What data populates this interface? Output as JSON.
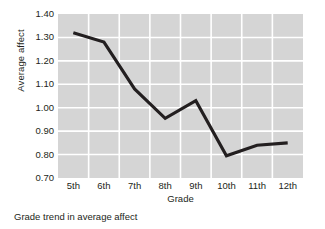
{
  "chart_data": {
    "type": "line",
    "title": "",
    "caption": "Grade trend in average affect",
    "xlabel": "Grade",
    "ylabel": "Average affect",
    "categories": [
      "5th",
      "6th",
      "7th",
      "8th",
      "9th",
      "10th",
      "11th",
      "12th"
    ],
    "values": [
      1.32,
      1.28,
      1.08,
      0.955,
      1.03,
      0.795,
      0.84,
      0.85
    ],
    "ylim": [
      0.7,
      1.4
    ],
    "yticks": [
      0.7,
      0.8,
      0.9,
      1.0,
      1.1,
      1.2,
      1.3,
      1.4
    ],
    "ytick_labels": [
      "0.70",
      "0.80",
      "0.90",
      "1.00",
      "1.10",
      "1.20",
      "1.30",
      "1.40"
    ],
    "grid": true,
    "legend": "none",
    "line_color": "#231f20",
    "plot_background": "#d5d5d5",
    "gridline_color": "#ffffff"
  }
}
